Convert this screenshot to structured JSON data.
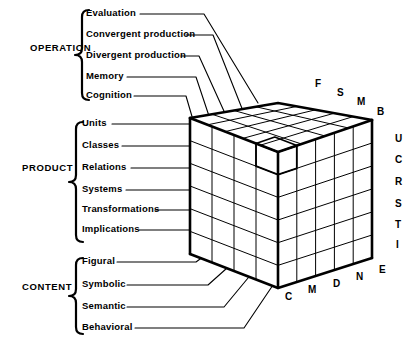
{
  "diagram": {
    "type": "three-dimensional-cube-classification",
    "ink_color": "#000000",
    "background_color": "#ffffff"
  },
  "categories": [
    {
      "id": "operation",
      "label": "OPERATION",
      "label_x": 30,
      "label_y": 52,
      "brace_x": 82,
      "brace_top": 10,
      "brace_bottom": 100,
      "items": [
        {
          "label": "Evaluation",
          "x": 86,
          "y": 17,
          "line_x1": 140,
          "line_x2": 204,
          "elbow_x": 258,
          "elbow_y": 103
        },
        {
          "label": "Convergent production",
          "x": 86,
          "y": 38,
          "line_x1": 186,
          "line_x2": 213,
          "elbow_x": 243,
          "elbow_y": 111
        },
        {
          "label": "Divergent production",
          "x": 86,
          "y": 59,
          "line_x1": 181,
          "line_x2": 199,
          "elbow_x": 228,
          "elbow_y": 120
        },
        {
          "label": "Memory",
          "x": 86,
          "y": 80,
          "line_x1": 127,
          "line_x2": 196,
          "elbow_x": 213,
          "elbow_y": 128
        },
        {
          "label": "Cognition",
          "x": 86,
          "y": 99,
          "line_x1": 134,
          "line_x2": 186,
          "elbow_x": 198,
          "elbow_y": 137
        }
      ]
    },
    {
      "id": "product",
      "label": "PRODUCT",
      "label_x": 22,
      "label_y": 172,
      "brace_x": 76,
      "brace_top": 122,
      "brace_bottom": 242,
      "items": [
        {
          "label": "Units",
          "x": 82,
          "y": 127,
          "line_x1": 112,
          "line_x2": 190
        },
        {
          "label": "Classes",
          "x": 82,
          "y": 149,
          "line_x1": 122,
          "line_x2": 190
        },
        {
          "label": "Relations",
          "x": 82,
          "y": 171,
          "line_x1": 131,
          "line_x2": 190
        },
        {
          "label": "Systems",
          "x": 82,
          "y": 193,
          "line_x1": 126,
          "line_x2": 190
        },
        {
          "label": "Transformations",
          "x": 82,
          "y": 213,
          "line_x1": 155,
          "line_x2": 190
        },
        {
          "label": "Implications",
          "x": 82,
          "y": 233,
          "line_x1": 139,
          "line_x2": 190
        }
      ]
    },
    {
      "id": "content",
      "label": "CONTENT",
      "label_x": 22,
      "label_y": 291,
      "brace_x": 76,
      "brace_top": 258,
      "brace_bottom": 334,
      "items": [
        {
          "label": "Figural",
          "x": 82,
          "y": 265,
          "line_x1": 117,
          "line_x2": 196,
          "elbow_x": 215,
          "elbow_y": 248
        },
        {
          "label": "Symbolic",
          "x": 82,
          "y": 288,
          "line_x1": 127,
          "line_x2": 208,
          "elbow_x": 236,
          "elbow_y": 260
        },
        {
          "label": "Semantic",
          "x": 82,
          "y": 310,
          "line_x1": 127,
          "line_x2": 224,
          "elbow_x": 253,
          "elbow_y": 272
        },
        {
          "label": "Behavioral",
          "x": 82,
          "y": 331,
          "line_x1": 135,
          "line_x2": 244,
          "elbow_x": 273,
          "elbow_y": 285
        }
      ]
    }
  ],
  "cube": {
    "geometry": {
      "left_top": {
        "x": 190,
        "y": 118
      },
      "back_top": {
        "x": 278,
        "y": 103
      },
      "right_top": {
        "x": 372,
        "y": 120
      },
      "front_top": {
        "x": 278,
        "y": 152
      },
      "left_bot": {
        "x": 190,
        "y": 254
      },
      "front_bot": {
        "x": 278,
        "y": 288
      },
      "right_bot": {
        "x": 372,
        "y": 258
      },
      "left_cols": 4,
      "right_cols": 5,
      "rows": 6
    },
    "top_edge_letters": [
      {
        "letter": "F",
        "x": 315,
        "y": 88
      },
      {
        "letter": "S",
        "x": 337,
        "y": 97
      },
      {
        "letter": "M",
        "x": 357,
        "y": 106
      },
      {
        "letter": "B",
        "x": 377,
        "y": 116
      }
    ],
    "right_edge_letters": [
      {
        "letter": "U",
        "x": 395,
        "y": 143
      },
      {
        "letter": "C",
        "x": 395,
        "y": 164
      },
      {
        "letter": "R",
        "x": 395,
        "y": 186
      },
      {
        "letter": "S",
        "x": 395,
        "y": 208
      },
      {
        "letter": "T",
        "x": 395,
        "y": 229
      },
      {
        "letter": "I",
        "x": 396,
        "y": 249
      }
    ],
    "bottom_edge_letters": [
      {
        "letter": "C",
        "x": 285,
        "y": 301
      },
      {
        "letter": "M",
        "x": 308,
        "y": 294
      },
      {
        "letter": "D",
        "x": 333,
        "y": 288
      },
      {
        "letter": "N",
        "x": 356,
        "y": 281
      },
      {
        "letter": "E",
        "x": 379,
        "y": 274
      }
    ]
  }
}
